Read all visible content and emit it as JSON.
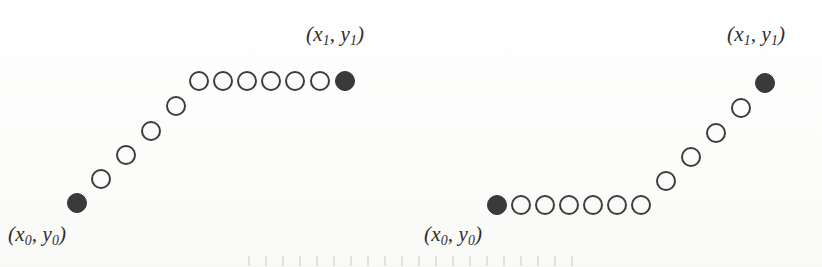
{
  "figure": {
    "background_color": "#fdfdfc",
    "marker": {
      "diameter_px": 20,
      "open_stroke_color": "#3c3c3c",
      "filled_color": "#3a3a3a"
    },
    "panels": [
      {
        "id": "left",
        "name": "left-path-diagram",
        "description": "Rasterized path rising diagonally then running horizontally",
        "start_label": {
          "open_paren": "(",
          "x_var": "x",
          "x_sub": "0",
          "comma": ", ",
          "y_var": "y",
          "y_sub": "0",
          "close_paren": ")",
          "x_px": 8,
          "y_px": 222
        },
        "end_label": {
          "open_paren": "(",
          "x_var": "x",
          "x_sub": "1",
          "comma": ", ",
          "y_var": "y",
          "y_sub": "1",
          "close_paren": ")",
          "x_px": 306,
          "y_px": 22
        },
        "markers": [
          {
            "type": "filled",
            "cx": 77,
            "cy": 203
          },
          {
            "type": "open",
            "cx": 101,
            "cy": 179
          },
          {
            "type": "open",
            "cx": 126,
            "cy": 155
          },
          {
            "type": "open",
            "cx": 151,
            "cy": 131
          },
          {
            "type": "open",
            "cx": 176,
            "cy": 106
          },
          {
            "type": "open",
            "cx": 199,
            "cy": 81
          },
          {
            "type": "open",
            "cx": 223,
            "cy": 81
          },
          {
            "type": "open",
            "cx": 247,
            "cy": 81
          },
          {
            "type": "open",
            "cx": 271,
            "cy": 81
          },
          {
            "type": "open",
            "cx": 295,
            "cy": 81
          },
          {
            "type": "open",
            "cx": 320,
            "cy": 81
          },
          {
            "type": "filled",
            "cx": 345,
            "cy": 81
          }
        ]
      },
      {
        "id": "right",
        "name": "right-path-diagram",
        "description": "Rasterized path running horizontally then rising diagonally",
        "start_label": {
          "open_paren": "(",
          "x_var": "x",
          "x_sub": "0",
          "comma": ", ",
          "y_var": "y",
          "y_sub": "0",
          "close_paren": ")",
          "x_px": 424,
          "y_px": 222
        },
        "end_label": {
          "open_paren": "(",
          "x_var": "x",
          "x_sub": "1",
          "comma": ", ",
          "y_var": "y",
          "y_sub": "1",
          "close_paren": ")",
          "x_px": 727,
          "y_px": 22
        },
        "markers": [
          {
            "type": "filled",
            "cx": 497,
            "cy": 205
          },
          {
            "type": "open",
            "cx": 521,
            "cy": 205
          },
          {
            "type": "open",
            "cx": 545,
            "cy": 205
          },
          {
            "type": "open",
            "cx": 569,
            "cy": 205
          },
          {
            "type": "open",
            "cx": 593,
            "cy": 205
          },
          {
            "type": "open",
            "cx": 617,
            "cy": 205
          },
          {
            "type": "open",
            "cx": 641,
            "cy": 205
          },
          {
            "type": "open",
            "cx": 666,
            "cy": 181
          },
          {
            "type": "open",
            "cx": 691,
            "cy": 157
          },
          {
            "type": "open",
            "cx": 716,
            "cy": 133
          },
          {
            "type": "open",
            "cx": 741,
            "cy": 108
          },
          {
            "type": "filled",
            "cx": 765,
            "cy": 83
          }
        ]
      }
    ]
  }
}
